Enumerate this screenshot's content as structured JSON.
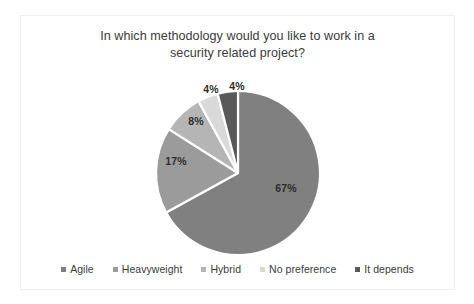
{
  "chart_data": {
    "type": "pie",
    "title": "In which methodology would you like to work in a security related project?",
    "title_lines": [
      "In which methodology would you like to work in a",
      "security related project?"
    ],
    "categories": [
      "Agile",
      "Heavyweight",
      "Hybrid",
      "No preference",
      "It depends"
    ],
    "values": [
      67,
      17,
      8,
      4,
      4
    ],
    "value_labels": [
      "67%",
      "17%",
      "8%",
      "4%",
      "4%"
    ],
    "unit": "%",
    "colors": [
      "#808080",
      "#9b9b9b",
      "#b5b5b5",
      "#d9d9d9",
      "#595959"
    ],
    "legend_position": "bottom",
    "grid": false,
    "start_angle_deg": 0,
    "direction": "clockwise",
    "slice_separator_color": "#ffffff",
    "slices": [
      {
        "label": "Agile",
        "value": 67,
        "value_label": "67%",
        "color": "#808080",
        "label_placement": "inside"
      },
      {
        "label": "Heavyweight",
        "value": 17,
        "value_label": "17%",
        "color": "#9b9b9b",
        "label_placement": "inside"
      },
      {
        "label": "Hybrid",
        "value": 8,
        "value_label": "8%",
        "color": "#b5b5b5",
        "label_placement": "inside"
      },
      {
        "label": "No preference",
        "value": 4,
        "value_label": "4%",
        "color": "#d9d9d9",
        "label_placement": "outside"
      },
      {
        "label": "It depends",
        "value": 4,
        "value_label": "4%",
        "color": "#595959",
        "label_placement": "outside"
      }
    ]
  },
  "legend": {
    "items": [
      {
        "label": "Agile",
        "color": "#808080"
      },
      {
        "label": "Heavyweight",
        "color": "#9b9b9b"
      },
      {
        "label": "Hybrid",
        "color": "#b5b5b5"
      },
      {
        "label": "No preference",
        "color": "#d9d9d9"
      },
      {
        "label": "It depends",
        "color": "#595959"
      }
    ]
  },
  "labels": {
    "agile": "67%",
    "heavyweight": "17%",
    "hybrid": "8%",
    "no_preference": "4%",
    "it_depends": "4%"
  }
}
